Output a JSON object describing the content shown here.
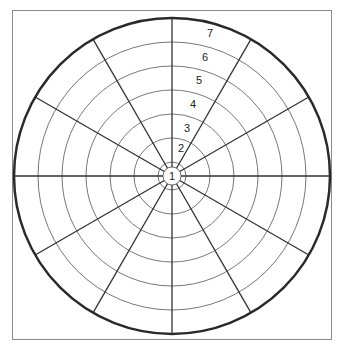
{
  "diagram": {
    "type": "polar-target-grid",
    "center": {
      "x": 172,
      "y": 176
    },
    "outer_radius": 158,
    "ring_radii": [
      9,
      14,
      38,
      62,
      86,
      110,
      134
    ],
    "spoke_count": 12,
    "spoke_angle_step_deg": 30,
    "ring_labels": [
      {
        "text": "1",
        "x": 172,
        "y": 180
      },
      {
        "text": "2",
        "x": 181,
        "y": 152
      },
      {
        "text": "3",
        "x": 187,
        "y": 132
      },
      {
        "text": "4",
        "x": 193,
        "y": 108
      },
      {
        "text": "5",
        "x": 199,
        "y": 84
      },
      {
        "text": "6",
        "x": 205,
        "y": 61
      },
      {
        "text": "7",
        "x": 210,
        "y": 37
      }
    ],
    "colors": {
      "outer_circle": "#2a2a2a",
      "spokes": "#333333",
      "rings": "#777777",
      "frame": "#8a8a8a"
    }
  }
}
